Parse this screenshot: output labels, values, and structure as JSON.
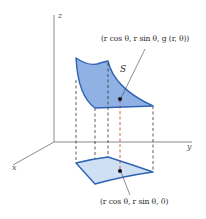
{
  "diagram": {
    "type": "3d-surface-projection",
    "axes": {
      "z_label": "z",
      "y_label": "y",
      "x_label": "x"
    },
    "surface": {
      "label": "S",
      "point_label": "(r cos θ, r sin θ, g (r, θ))"
    },
    "region": {
      "point_label": "(r cos θ, r sin θ, 0)"
    },
    "colors": {
      "surface_fill": "#8fb1e3",
      "region_fill": "#cfe0f5",
      "edge": "#2f63b4",
      "axis": "#8a8a8a",
      "dashed": "#333333",
      "highlight_dashed": "#c0392b",
      "point": "#111111"
    }
  }
}
